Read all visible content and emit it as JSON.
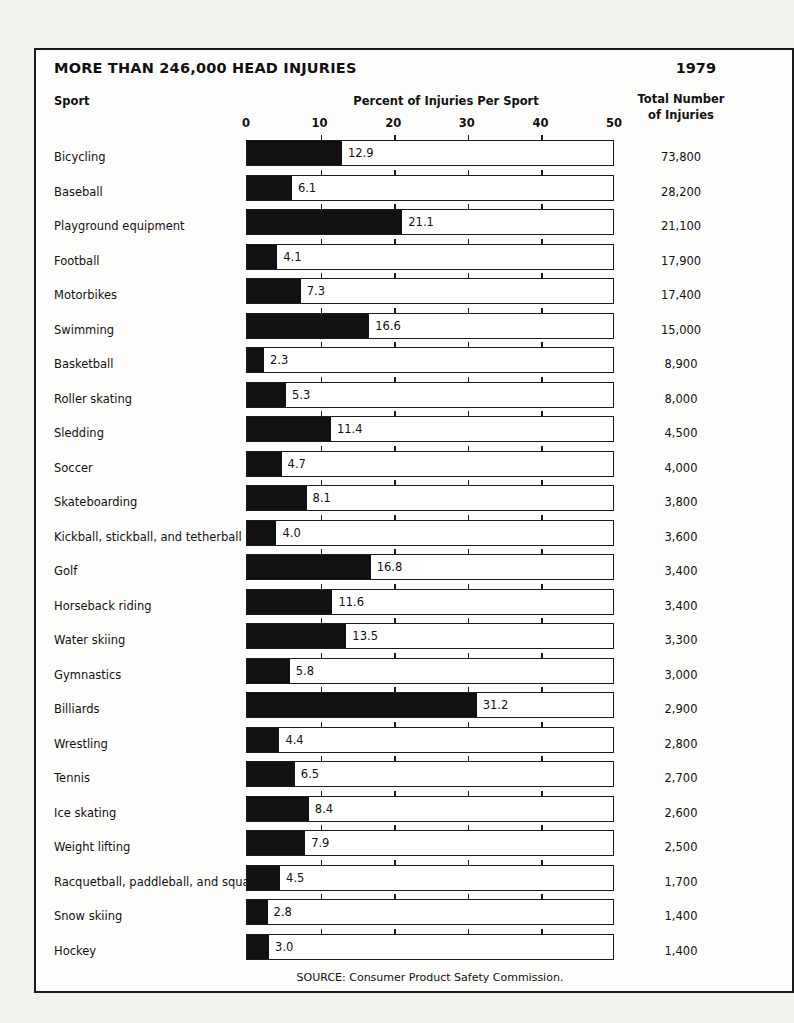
{
  "header": {
    "title": "MORE THAN 246,000 HEAD INJURIES",
    "year": "1979",
    "sport_column_header": "Sport",
    "percent_column_header": "Percent of Injuries Per Sport",
    "total_column_header_line1": "Total Number",
    "total_column_header_line2": "of Injuries"
  },
  "source": "SOURCE: Consumer Product Safety Commission.",
  "chart_data": {
    "type": "bar",
    "orientation": "horizontal",
    "title": "MORE THAN 246,000 HEAD INJURIES",
    "subtitle": "1979",
    "xlabel": "Percent of Injuries Per Sport",
    "ylabel": "Sport",
    "xlim": [
      0,
      50
    ],
    "xticks": [
      0,
      10,
      20,
      30,
      40,
      50
    ],
    "xticklabels": [
      "0",
      "10",
      "20",
      "30",
      "40",
      "50"
    ],
    "grid": false,
    "legend": false,
    "bar_color": "#111111",
    "track_color": "#ffffff",
    "categories": [
      "Bicycling",
      "Baseball",
      "Playground equipment",
      "Football",
      "Motorbikes",
      "Swimming",
      "Basketball",
      "Roller skating",
      "Sledding",
      "Soccer",
      "Skateboarding",
      "Kickball, stickball, and tetherball",
      "Golf",
      "Horseback riding",
      "Water skiing",
      "Gymnastics",
      "Billiards",
      "Wrestling",
      "Tennis",
      "Ice skating",
      "Weight lifting",
      "Racquetball, paddleball, and squash",
      "Snow skiing",
      "Hockey"
    ],
    "values": [
      12.9,
      6.1,
      21.1,
      4.1,
      7.3,
      16.6,
      2.3,
      5.3,
      11.4,
      4.7,
      8.1,
      4.0,
      16.8,
      11.6,
      13.5,
      5.8,
      31.2,
      4.4,
      6.5,
      8.4,
      7.9,
      4.5,
      2.8,
      3.0
    ],
    "value_labels": [
      "12.9",
      "6.1",
      "21.1",
      "4.1",
      "7.3",
      "16.6",
      "2.3",
      "5.3",
      "11.4",
      "4.7",
      "8.1",
      "4.0",
      "16.8",
      "11.6",
      "13.5",
      "5.8",
      "31.2",
      "4.4",
      "6.5",
      "8.4",
      "7.9",
      "4.5",
      "2.8",
      "3.0"
    ],
    "totals": [
      "73,800",
      "28,200",
      "21,100",
      "17,900",
      "17,400",
      "15,000",
      "8,900",
      "8,000",
      "4,500",
      "4,000",
      "3,800",
      "3,600",
      "3,400",
      "3,400",
      "3,300",
      "3,000",
      "2,900",
      "2,800",
      "2,700",
      "2,600",
      "2,500",
      "1,700",
      "1,400",
      "1,400"
    ],
    "totals_series_name": "Total Number of Injuries"
  }
}
